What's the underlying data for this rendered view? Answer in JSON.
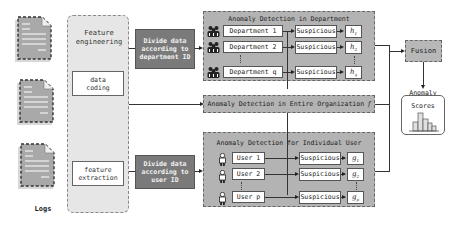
{
  "logs": {
    "label": "Logs",
    "documents": 3
  },
  "feature_engineering": {
    "title_line1": "Feature",
    "title_line2": "engineering",
    "data_coding_line1": "data",
    "data_coding_line2": "coding",
    "feature_extraction_line1": "feature",
    "feature_extraction_line2": "extraction"
  },
  "divide_department": {
    "line1": "Divide data",
    "line2": "according to",
    "line3": "department ID"
  },
  "divide_user": {
    "line1": "Divide data",
    "line2": "according to",
    "line3": "user ID"
  },
  "department_group": {
    "title": "Anomaly Detection in Department",
    "rows": [
      {
        "entity": "Department 1",
        "status": "Suspicious",
        "symbol": "h",
        "sub": "1"
      },
      {
        "entity": "Department 2",
        "status": "Suspicious",
        "symbol": "h",
        "sub": "2"
      },
      {
        "entity": "Department q",
        "status": "Suspicious",
        "symbol": "h",
        "sub": "q"
      }
    ]
  },
  "organization": {
    "title": "Anomaly Detection in Entire Organization",
    "symbol": "f"
  },
  "user_group": {
    "title": "Anomaly Detection for Individual User",
    "rows": [
      {
        "entity": "User 1",
        "status": "Suspicious",
        "symbol": "g",
        "sub": "1"
      },
      {
        "entity": "User 2",
        "status": "Suspicious",
        "symbol": "g",
        "sub": "2"
      },
      {
        "entity": "User p",
        "status": "Suspicious",
        "symbol": "g",
        "sub": "p"
      }
    ]
  },
  "fusion": {
    "label": "Fusion"
  },
  "anomaly_scores": {
    "line1": "Anomaly",
    "line2": "Scores"
  },
  "colors": {
    "group_fill": "#b3b3b3",
    "divide_fill": "#7a7a7a",
    "panel_fill": "#e6e6e6"
  }
}
